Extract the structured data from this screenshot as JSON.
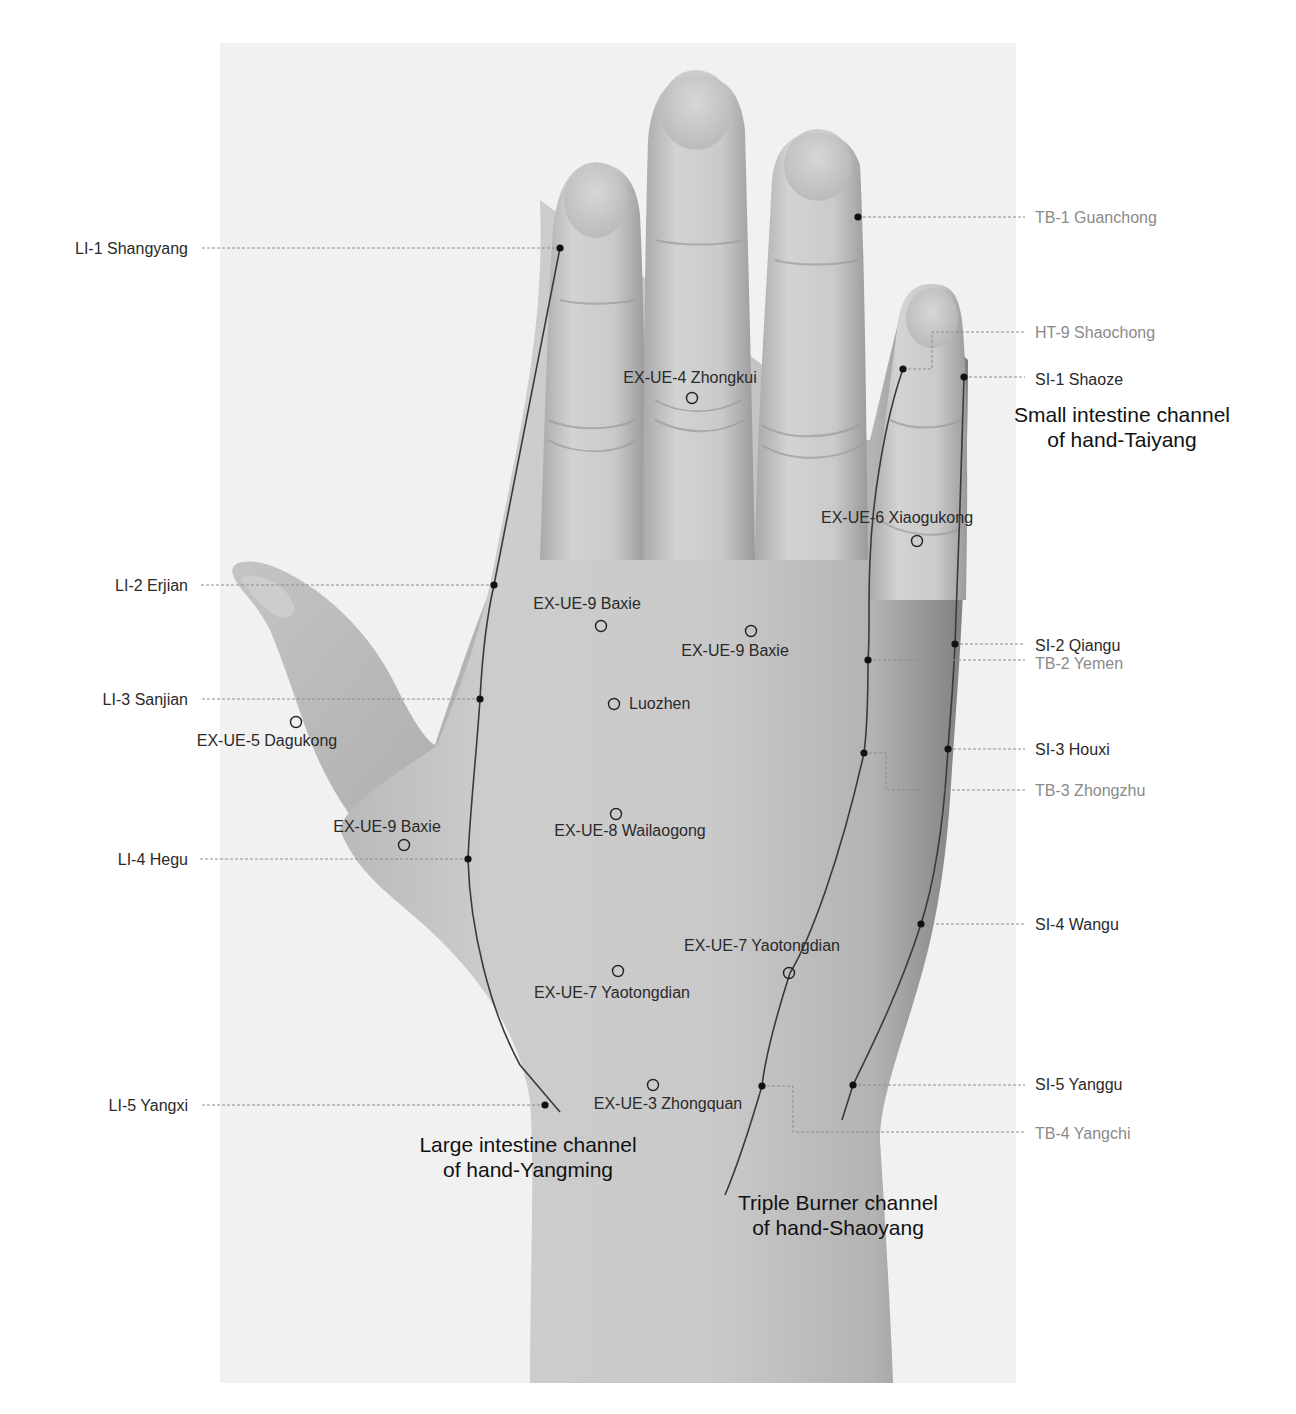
{
  "figure": {
    "width": 1296,
    "height": 1414,
    "photo_panel": {
      "x": 220,
      "y": 43,
      "w": 796,
      "h": 1340,
      "color": "#f1f1f1"
    },
    "colors": {
      "skin_light": "#d2d2d2",
      "skin_mid": "#bdbdbd",
      "skin_dark": "#8e8e8e",
      "crease": "#9a9a9a",
      "nail": "#c8c8c8",
      "channel_line": "#3a3a3a",
      "leader_line": "#8c8c8c",
      "point_fill": "#111111",
      "label_dark": "#2a2a2a",
      "label_light": "#8a8a8a",
      "title": "#111111"
    }
  },
  "channels": [
    {
      "id": "large-intestine",
      "title_lines": [
        "Large intestine channel",
        "of hand-Yangming"
      ],
      "title_pos": {
        "x": 528,
        "y": 1152
      },
      "path": "M560,248 L494,585 C486,620 482,660 480,699 C476,760 470,810 468,859 C470,930 490,1010 520,1065 L560,1112"
    },
    {
      "id": "triple-burner",
      "title_lines": [
        "Triple Burner channel",
        "of hand-Shaoyang"
      ],
      "title_pos": {
        "x": 838,
        "y": 1210
      },
      "path": "M903,369 C885,420 872,500 870,560 C868,600 870,640 868,660 C868,700 867,730 864,753 C840,860 810,940 790,973 C775,1020 765,1060 762,1086 C752,1120 740,1160 725,1195"
    },
    {
      "id": "small-intestine",
      "title_lines": [
        "Small intestine channel",
        "of hand-Taiyang"
      ],
      "title_pos": {
        "x": 1122,
        "y": 422
      },
      "path": "M964,377 C962,460 958,560 955,644 C953,690 950,720 948,749 C944,820 935,880 921,924 C900,990 870,1050 853,1085 L842,1120"
    }
  ],
  "meridian_points": [
    {
      "id": "LI-1",
      "label": "LI-1 Shangyang",
      "x": 560,
      "y": 248,
      "label_x": 188,
      "label_y": 248,
      "side": "left",
      "tone": "dark"
    },
    {
      "id": "LI-2",
      "label": "LI-2 Erjian",
      "x": 494,
      "y": 585,
      "label_x": 188,
      "label_y": 585,
      "side": "left",
      "tone": "dark"
    },
    {
      "id": "LI-3",
      "label": "LI-3 Sanjian",
      "x": 480,
      "y": 699,
      "label_x": 188,
      "label_y": 699,
      "side": "left",
      "tone": "dark"
    },
    {
      "id": "LI-4",
      "label": "LI-4 Hegu",
      "x": 468,
      "y": 859,
      "label_x": 188,
      "label_y": 859,
      "side": "left",
      "tone": "dark"
    },
    {
      "id": "LI-5",
      "label": "LI-5 Yangxi",
      "x": 545,
      "y": 1105,
      "label_x": 188,
      "label_y": 1105,
      "side": "left",
      "tone": "dark"
    },
    {
      "id": "TB-1",
      "label": "TB-1 Guanchong",
      "x": 858,
      "y": 217,
      "label_x": 1035,
      "label_y": 217,
      "side": "right",
      "tone": "light"
    },
    {
      "id": "HT-9",
      "label": "HT-9 Shaochong",
      "x": 903,
      "y": 369,
      "label_x": 1035,
      "label_y": 332,
      "side": "right",
      "tone": "light",
      "elbow": "M903,369 L932,369 L932,332 L968,332 L1025,332"
    },
    {
      "id": "SI-1",
      "label": "SI-1 Shaoze",
      "x": 964,
      "y": 377,
      "label_x": 1035,
      "label_y": 379,
      "side": "right",
      "tone": "dark"
    },
    {
      "id": "SI-2",
      "label": "SI-2 Qiangu",
      "x": 955,
      "y": 644,
      "label_x": 1035,
      "label_y": 645,
      "side": "right",
      "tone": "dark"
    },
    {
      "id": "TB-2",
      "label": "TB-2 Yemen",
      "x": 868,
      "y": 660,
      "label_x": 1035,
      "label_y": 663,
      "side": "right",
      "tone": "light"
    },
    {
      "id": "SI-3",
      "label": "SI-3 Houxi",
      "x": 948,
      "y": 749,
      "label_x": 1035,
      "label_y": 749,
      "side": "right",
      "tone": "dark"
    },
    {
      "id": "TB-3",
      "label": "TB-3 Zhongzhu",
      "x": 864,
      "y": 753,
      "label_x": 1035,
      "label_y": 790,
      "side": "right",
      "tone": "light",
      "elbow": "M864,753 L886,753 L886,790 L1025,790"
    },
    {
      "id": "SI-4",
      "label": "SI-4 Wangu",
      "x": 921,
      "y": 924,
      "label_x": 1035,
      "label_y": 924,
      "side": "right",
      "tone": "dark"
    },
    {
      "id": "SI-5",
      "label": "SI-5 Yanggu",
      "x": 853,
      "y": 1085,
      "label_x": 1035,
      "label_y": 1084,
      "side": "right",
      "tone": "dark"
    },
    {
      "id": "TB-4",
      "label": "TB-4 Yangchi",
      "x": 762,
      "y": 1086,
      "label_x": 1035,
      "label_y": 1133,
      "side": "right",
      "tone": "light",
      "elbow": "M762,1086 L793,1086 L793,1132 L1025,1132"
    }
  ],
  "extra_points": [
    {
      "id": "EX-UE-4",
      "label": "EX-UE-4 Zhongkui",
      "x": 692,
      "y": 398,
      "label_x": 690,
      "label_y": 383,
      "anchor": "middle"
    },
    {
      "id": "EX-UE-6",
      "label": "EX-UE-6 Xiaogukong",
      "x": 917,
      "y": 541,
      "label_x": 897,
      "label_y": 523,
      "anchor": "middle"
    },
    {
      "id": "EX-UE-9-a",
      "label": "EX-UE-9 Baxie",
      "x": 601,
      "y": 626,
      "label_x": 587,
      "label_y": 609,
      "anchor": "middle"
    },
    {
      "id": "EX-UE-9-b",
      "label": "EX-UE-9 Baxie",
      "x": 751,
      "y": 631,
      "label_x": 735,
      "label_y": 656,
      "anchor": "middle"
    },
    {
      "id": "LUOZHEN",
      "label": "Luozhen",
      "x": 614,
      "y": 704,
      "label_x": 629,
      "label_y": 709,
      "anchor": "start"
    },
    {
      "id": "EX-UE-5",
      "label": "EX-UE-5 Dagukong",
      "x": 296,
      "y": 722,
      "label_x": 267,
      "label_y": 746,
      "anchor": "middle"
    },
    {
      "id": "EX-UE-8",
      "label": "EX-UE-8 Wailaogong",
      "x": 616,
      "y": 814,
      "label_x": 630,
      "label_y": 836,
      "anchor": "middle"
    },
    {
      "id": "EX-UE-9-c",
      "label": "EX-UE-9 Baxie",
      "x": 404,
      "y": 845,
      "label_x": 387,
      "label_y": 832,
      "anchor": "middle"
    },
    {
      "id": "EX-UE-7-a",
      "label": "EX-UE-7 Yaotongdian",
      "x": 789,
      "y": 973,
      "label_x": 762,
      "label_y": 951,
      "anchor": "middle"
    },
    {
      "id": "EX-UE-7-b",
      "label": "EX-UE-7 Yaotongdian",
      "x": 618,
      "y": 971,
      "label_x": 612,
      "label_y": 998,
      "anchor": "middle"
    },
    {
      "id": "EX-UE-3",
      "label": "EX-UE-3 Zhongquan",
      "x": 653,
      "y": 1085,
      "label_x": 668,
      "label_y": 1109,
      "anchor": "middle"
    }
  ]
}
